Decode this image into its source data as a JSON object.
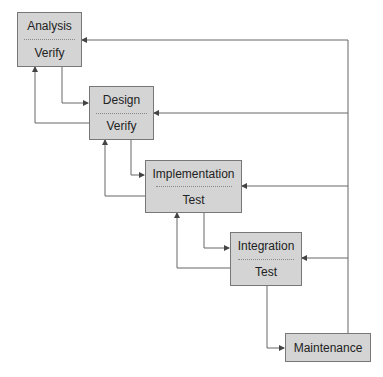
{
  "diagram": {
    "type": "waterfall-model",
    "stages": [
      {
        "id": "analysis",
        "title": "Analysis",
        "check": "Verify"
      },
      {
        "id": "design",
        "title": "Design",
        "check": "Verify"
      },
      {
        "id": "implementation",
        "title": "Implementation",
        "check": "Test"
      },
      {
        "id": "integration",
        "title": "Integration",
        "check": "Test"
      },
      {
        "id": "maintenance",
        "title": "Maintenance"
      }
    ],
    "colors": {
      "box_fill": "#d4d4d4",
      "box_border": "#777777",
      "line": "#666666"
    }
  }
}
